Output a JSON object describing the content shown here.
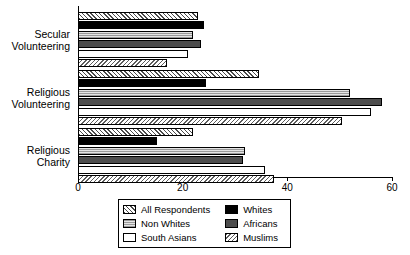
{
  "chart_data": {
    "type": "bar",
    "orientation": "horizontal",
    "title": "",
    "xlabel": "",
    "ylabel": "",
    "xlim": [
      0,
      60
    ],
    "xticks": [
      0,
      20,
      40,
      60
    ],
    "xtick_labels": [
      "0",
      "20",
      "40",
      "60"
    ],
    "grid": false,
    "legend_position": "bottom",
    "categories": [
      "Secular Volunteering",
      "Religious Volunteering",
      "Religious Charity"
    ],
    "category_labels": [
      "Secular\nVolunteering",
      "Religious\nVolunteering",
      "Religious\nCharity"
    ],
    "series": [
      {
        "name": "All Respondents",
        "pattern": "diagonal-hatch-forward",
        "values": [
          23,
          34.5,
          22
        ]
      },
      {
        "name": "Whites",
        "pattern": "solid-black",
        "values": [
          24,
          24.5,
          15
        ]
      },
      {
        "name": "Non Whites",
        "pattern": "light-dots",
        "values": [
          22,
          52,
          32
        ]
      },
      {
        "name": "Africans",
        "pattern": "solid-dark-gray",
        "values": [
          23.5,
          58,
          31.5
        ]
      },
      {
        "name": "South Asians",
        "pattern": "white-fill",
        "values": [
          21,
          56,
          35.7
        ]
      },
      {
        "name": "Muslims",
        "pattern": "diagonal-hatch-back",
        "values": [
          17,
          50.5,
          37.5
        ]
      }
    ]
  },
  "legend": {
    "column_left": [
      {
        "label": "All Respondents",
        "swatch": "sw-all"
      },
      {
        "label": "Non Whites",
        "swatch": "sw-nonwhite"
      },
      {
        "label": "South Asians",
        "swatch": "sw-south"
      }
    ],
    "column_right": [
      {
        "label": "Whites",
        "swatch": "sw-whites"
      },
      {
        "label": "Africans",
        "swatch": "sw-africans"
      },
      {
        "label": "Muslims",
        "swatch": "sw-muslims"
      }
    ]
  },
  "colors": {
    "axis": "#000000",
    "whites": "#000000",
    "africans": "#4d4d4d",
    "non_whites": "#d8d8d8",
    "south_asians": "#ffffff",
    "background": "#ffffff"
  }
}
